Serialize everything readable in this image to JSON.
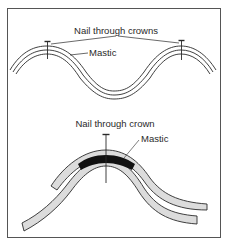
{
  "figure": {
    "frame_color": "#555555",
    "line_color": "#2a2a2a",
    "sheet_fill": "#dcdcdc",
    "mastic_fill": "#111111",
    "top_diagram": {
      "label_nails": "Nail through crowns",
      "label_mastic": "Mastic",
      "nail_count": 2
    },
    "bottom_diagram": {
      "label_nail": "Nail through crown",
      "label_mastic": "Mastic",
      "nail_count": 1
    }
  }
}
